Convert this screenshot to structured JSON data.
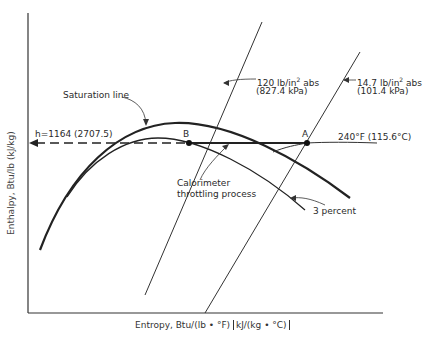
{
  "diagram": {
    "y_axis_label": "Enthalpy, Btu/lb (kJ/kg)",
    "x_axis_label_main": "Entropy, Btu/(lb • °F)",
    "x_axis_label_si": "kJ/(kg • °C)",
    "saturation_label": "Saturation line",
    "enthalpy_label": "h=1164 (2707.5)",
    "point_b": "B",
    "point_a": "A",
    "temp_label": "240°F (115.6°C)",
    "p1_label_a": "120 lb/in",
    "p1_sup": "2",
    "p1_label_b": " abs",
    "p1_si": "(827.4 kPa)",
    "p2_label_a": "14.7 lb/in",
    "p2_sup": "2",
    "p2_label_b": " abs",
    "p2_si": "(101.4 kPa)",
    "calorimeter_line1": "Calorimeter",
    "calorimeter_line2": "throttling process",
    "moisture_label": "3 percent"
  },
  "colors": {
    "ink": "#2a2a2a",
    "background": "#ffffff"
  }
}
